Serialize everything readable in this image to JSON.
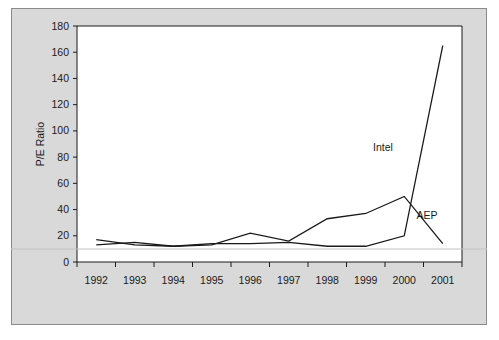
{
  "figure": {
    "background_color": "#d9d9d9",
    "plot_background_color": "#ffffff",
    "border_color": "#8a8a8a",
    "line_color": "#1a1a1a",
    "axis_color": "#1a1a1a"
  },
  "chart_data": {
    "type": "line",
    "title": "",
    "xlabel": "",
    "ylabel": "P/E Ratio",
    "categories": [
      "1992",
      "1993",
      "1994",
      "1995",
      "1996",
      "1997",
      "1998",
      "1999",
      "2000",
      "2001"
    ],
    "yticks": [
      0,
      20,
      40,
      60,
      80,
      100,
      120,
      140,
      160,
      180
    ],
    "ylim": [
      0,
      180
    ],
    "grid": false,
    "legend_position": "inline-annotation",
    "series": [
      {
        "name": "Intel",
        "values": [
          13,
          15,
          12,
          14,
          14,
          15,
          12,
          12,
          20,
          165
        ],
        "annotation": "Intel"
      },
      {
        "name": "AEP",
        "values": [
          17,
          13,
          12,
          13,
          22,
          16,
          33,
          37,
          50,
          14
        ],
        "annotation": "AEP"
      }
    ],
    "annotations": [
      {
        "text": "Intel",
        "x": 383,
        "y": 151
      },
      {
        "text": "AEP",
        "x": 427,
        "y": 219
      }
    ]
  }
}
